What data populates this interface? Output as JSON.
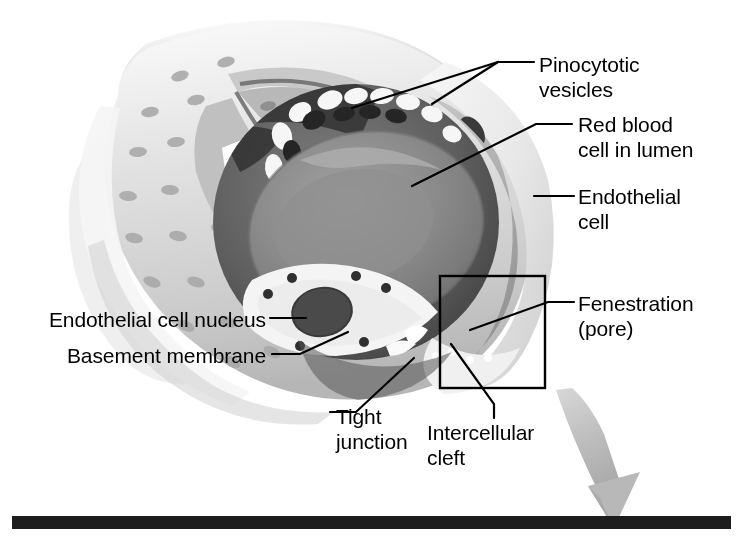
{
  "figure": {
    "width": 743,
    "height": 540,
    "background_color": "#ffffff",
    "ink_color": "#000000"
  },
  "labels": {
    "pinocytotic_vesicles": "Pinocytotic\nvesicles",
    "red_blood_cell": "Red blood\ncell in lumen",
    "endothelial_cell": "Endothelial\ncell",
    "fenestration": "Fenestration\n(pore)",
    "endothelial_cell_nucleus": "Endothelial cell nucleus",
    "basement_membrane": "Basement membrane",
    "tight_junction": "Tight\njunction",
    "intercellular_cleft": "Intercellular\ncleft"
  },
  "callout_box": {
    "name": "magnification-region",
    "x": 440,
    "y": 276,
    "width": 105,
    "height": 112,
    "stroke": "#000000"
  },
  "zoom_arrow": {
    "name": "magnification-arrow",
    "color": "#b4b4b4",
    "from_x": 560,
    "from_y": 392,
    "to_x": 615,
    "to_y": 528
  },
  "palette": {
    "outer_wall_light": "#e6e6e6",
    "outer_wall_mid": "#cfcfcf",
    "outer_wall_shadow": "#a8a8a8",
    "inner_wall": "#b9b9b9",
    "lumen_dark": "#6f6f6f",
    "lumen_darkest": "#3c3c3c",
    "red_blood_cell": "#8a8a8a",
    "red_blood_cell_rim": "#777777",
    "basement_membrane": "#f2f2f2",
    "nucleus": "#4a4a4a",
    "pore_dark": "#2b2b2b",
    "vesicle_light": "#f4f4f4",
    "bottom_bar": "#1d1d1d"
  },
  "bottom_bar": {
    "name": "page-rule",
    "color": "#1d1d1d"
  }
}
